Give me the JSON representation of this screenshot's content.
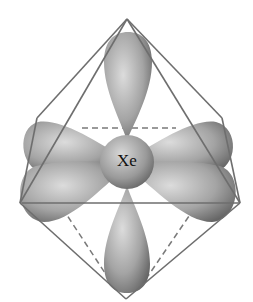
{
  "diagram": {
    "central_atom_label": "Xe",
    "shape": "octahedron",
    "lobes": [
      "top",
      "bottom",
      "upper-left",
      "lower-left",
      "upper-right",
      "lower-right"
    ],
    "colors": {
      "edge": "#6e6e6e",
      "lobe_light": "#d6d6d6",
      "lobe_dark": "#6a6a6a",
      "background": "#ffffff"
    }
  }
}
